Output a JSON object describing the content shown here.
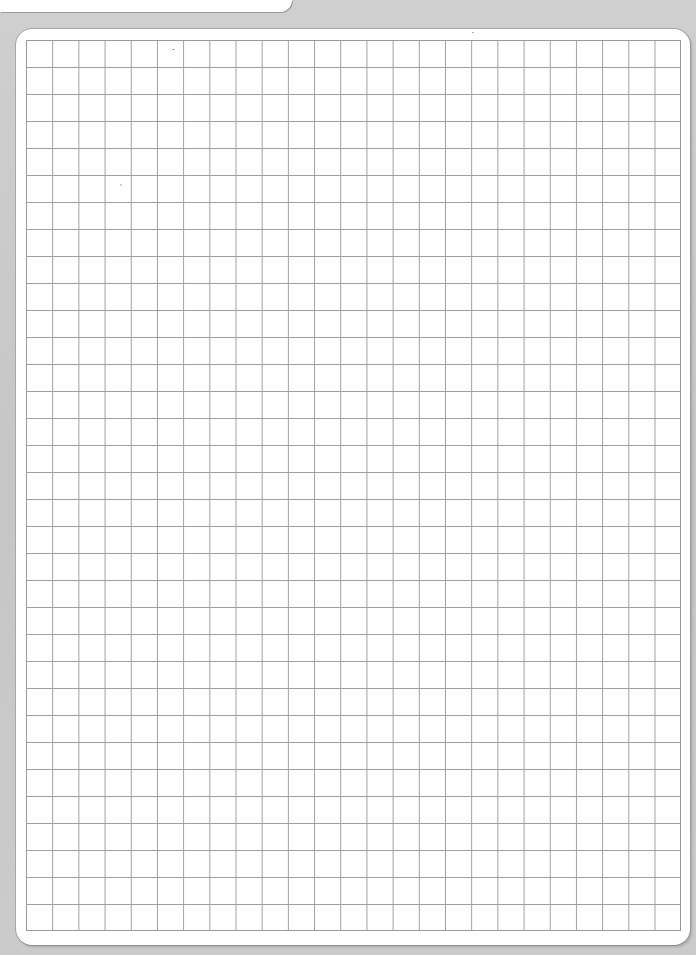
{
  "page": {
    "type": "graph-paper-sheet",
    "background_color": "#c9c9c9",
    "paper_color": "#ffffff",
    "grid_line_color": "#9e9e9e"
  },
  "grid": {
    "columns": 25,
    "rows": 33,
    "cell_width_px": 26.2,
    "cell_height_px": 27
  }
}
